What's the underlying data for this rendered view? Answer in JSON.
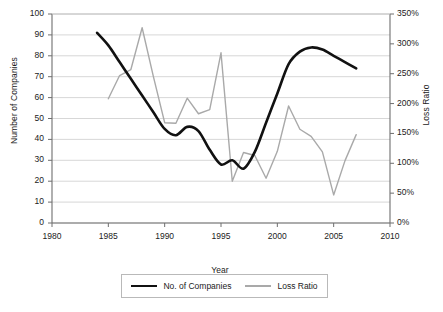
{
  "chart_data": {
    "type": "line",
    "title": "",
    "xlabel": "Year",
    "ylabel": "Number of Companies",
    "y2label": "Loss Ratio",
    "grid": true,
    "legend_position": "bottom",
    "xlim": [
      1980,
      2010
    ],
    "ylim": [
      0,
      100
    ],
    "y2lim": [
      0,
      350
    ],
    "xticks": [
      "1980",
      "1985",
      "1990",
      "1995",
      "2000",
      "2005",
      "2010"
    ],
    "xtick_values": [
      1980,
      1985,
      1990,
      1995,
      2000,
      2005,
      2010
    ],
    "yticks": [
      "0",
      "10",
      "20",
      "30",
      "40",
      "50",
      "60",
      "70",
      "80",
      "90",
      "100"
    ],
    "ytick_values": [
      0,
      10,
      20,
      30,
      40,
      50,
      60,
      70,
      80,
      90,
      100
    ],
    "y2ticks": [
      "0%",
      "50%",
      "100%",
      "150%",
      "200%",
      "250%",
      "300%",
      "350%"
    ],
    "y2tick_values": [
      0,
      50,
      100,
      150,
      200,
      250,
      300,
      350
    ],
    "series": [
      {
        "name": "No. of Companies",
        "axis": "left",
        "color": "#111111",
        "width": 2.6,
        "smooth": true,
        "x": [
          1984,
          1985,
          1986,
          1987,
          1988,
          1989,
          1990,
          1991,
          1992,
          1993,
          1994,
          1995,
          1996,
          1997,
          1998,
          1999,
          2000,
          2001,
          2002,
          2003,
          2004,
          2005,
          2006,
          2007
        ],
        "values": [
          91,
          85,
          77,
          69,
          61,
          53,
          45,
          42,
          46,
          44,
          35,
          28,
          30,
          26,
          34,
          48,
          62,
          76,
          82,
          84,
          83,
          80,
          77,
          74
        ],
        "values_note": "left axis: number of companies"
      },
      {
        "name": "Loss Ratio",
        "axis": "right",
        "color": "#a9a9a9",
        "width": 1.4,
        "smooth": false,
        "x": [
          1985,
          1986,
          1987,
          1988,
          1989,
          1990,
          1991,
          1992,
          1993,
          1994,
          1995,
          1996,
          1997,
          1998,
          1999,
          2000,
          2001,
          2002,
          2003,
          2004,
          2005,
          2006,
          2007
        ],
        "values": [
          208,
          247,
          257,
          327,
          245,
          168,
          167,
          209,
          183,
          190,
          285,
          70,
          118,
          113,
          75,
          120,
          196,
          157,
          145,
          119,
          47,
          104,
          148
        ],
        "values_note": "right axis: loss ratio percent"
      }
    ]
  },
  "legend": {
    "items": [
      {
        "label": "No. of Companies"
      },
      {
        "label": "Loss Ratio"
      }
    ]
  }
}
